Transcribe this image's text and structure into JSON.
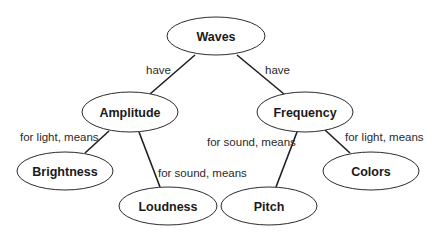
{
  "diagram": {
    "type": "concept-map",
    "nodes": {
      "waves": {
        "label": "Waves",
        "cx": 216,
        "cy": 36,
        "rx": 49,
        "ry": 19
      },
      "amplitude": {
        "label": "Amplitude",
        "cx": 130,
        "cy": 112,
        "rx": 48,
        "ry": 20
      },
      "frequency": {
        "label": "Frequency",
        "cx": 305,
        "cy": 112,
        "rx": 48,
        "ry": 20
      },
      "brightness": {
        "label": "Brightness",
        "cx": 65,
        "cy": 171,
        "rx": 48,
        "ry": 19
      },
      "loudness": {
        "label": "Loudness",
        "cx": 168,
        "cy": 206,
        "rx": 49,
        "ry": 19
      },
      "pitch": {
        "label": "Pitch",
        "cx": 269,
        "cy": 206,
        "rx": 48,
        "ry": 19
      },
      "colors": {
        "label": "Colors",
        "cx": 371,
        "cy": 171,
        "rx": 48,
        "ry": 19
      }
    },
    "edges": {
      "waves_amplitude": {
        "from": "Waves",
        "to": "Amplitude",
        "label": "have"
      },
      "waves_frequency": {
        "from": "Waves",
        "to": "Frequency",
        "label": "have"
      },
      "amplitude_brightness": {
        "from": "Amplitude",
        "to": "Brightness",
        "label": "for light, means"
      },
      "amplitude_loudness": {
        "from": "Amplitude",
        "to": "Loudness",
        "label": "for sound, means"
      },
      "frequency_pitch": {
        "from": "Frequency",
        "to": "Pitch",
        "label": "for sound, means"
      },
      "frequency_colors": {
        "from": "Frequency",
        "to": "Colors",
        "label": "for light, means"
      }
    }
  }
}
